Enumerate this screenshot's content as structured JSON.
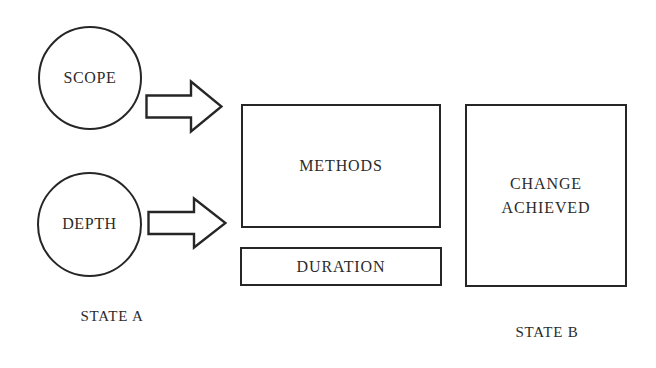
{
  "diagram": {
    "background_color": "#ffffff",
    "stroke_color": "#262626",
    "text_color": "#2b2b2b",
    "inputs": [
      {
        "id": "scope",
        "label": "SCOPE",
        "shape": "circle"
      },
      {
        "id": "depth",
        "label": "DEPTH",
        "shape": "circle"
      }
    ],
    "arrows": [
      {
        "id": "arrow-scope",
        "direction": "right",
        "style": "hollow-block-arrow"
      },
      {
        "id": "arrow-depth",
        "direction": "right",
        "style": "hollow-block-arrow"
      }
    ],
    "process_boxes": [
      {
        "id": "methods",
        "label": "METHODS",
        "shape": "rectangle"
      },
      {
        "id": "duration",
        "label": "DURATION",
        "shape": "rectangle"
      }
    ],
    "outcome_boxes": [
      {
        "id": "change-achieved",
        "label": "CHANGE\nACHIEVED",
        "line1": "CHANGE",
        "line2": "ACHIEVED",
        "shape": "rectangle"
      }
    ],
    "state_labels": {
      "left": "STATE A",
      "right": "STATE B"
    }
  }
}
